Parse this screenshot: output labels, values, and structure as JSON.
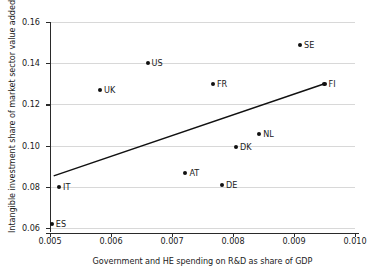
{
  "chart_data": {
    "type": "scatter",
    "title": "",
    "xlabel": "Government and HE spending on R&D as share of GDP",
    "ylabel": "Intangible investment share of market sector value added",
    "xlim": [
      0.005,
      0.01
    ],
    "ylim": [
      0.06,
      0.165
    ],
    "xticks": [
      "0.005",
      "0.006",
      "0.007",
      "0.008",
      "0.009",
      "0.010"
    ],
    "xtick_values": [
      0.005,
      0.006,
      0.007,
      0.008,
      0.009,
      0.01
    ],
    "yticks": [
      "0.06",
      "0.08",
      "0.10",
      "0.12",
      "0.14",
      "0.16"
    ],
    "ytick_values": [
      0.06,
      0.08,
      0.1,
      0.12,
      0.14,
      0.16
    ],
    "grid": "horizontal",
    "legend": "none",
    "point_color": "#111111",
    "line_color": "#111111",
    "grid_color": "#d8d8d8",
    "points": [
      {
        "label": "ES",
        "x": 0.00503,
        "y": 0.062
      },
      {
        "label": "IT",
        "x": 0.00515,
        "y": 0.08
      },
      {
        "label": "UK",
        "x": 0.00582,
        "y": 0.127
      },
      {
        "label": "US",
        "x": 0.0066,
        "y": 0.14
      },
      {
        "label": "AT",
        "x": 0.00722,
        "y": 0.0865
      },
      {
        "label": "FR",
        "x": 0.00767,
        "y": 0.13
      },
      {
        "label": "DE",
        "x": 0.00782,
        "y": 0.081
      },
      {
        "label": "DK",
        "x": 0.00805,
        "y": 0.0995
      },
      {
        "label": "NL",
        "x": 0.00843,
        "y": 0.1055
      },
      {
        "label": "SE",
        "x": 0.0091,
        "y": 0.149
      },
      {
        "label": "FI",
        "x": 0.0095,
        "y": 0.13
      }
    ],
    "trendline": {
      "name": "fitted regression line",
      "x0": 0.00506,
      "y0": 0.0853,
      "x1": 0.0095,
      "y1": 0.13
    }
  }
}
